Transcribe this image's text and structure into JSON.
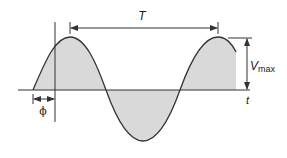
{
  "diagram": {
    "type": "sinusoid-phase-diagram",
    "labels": {
      "period": "T",
      "amplitude_main": "V",
      "amplitude_sub": "max",
      "time_axis": "t",
      "phase": "ϕ"
    },
    "colors": {
      "stroke": "#333333",
      "fill": "#d9d9d9",
      "background": "#ffffff"
    }
  }
}
